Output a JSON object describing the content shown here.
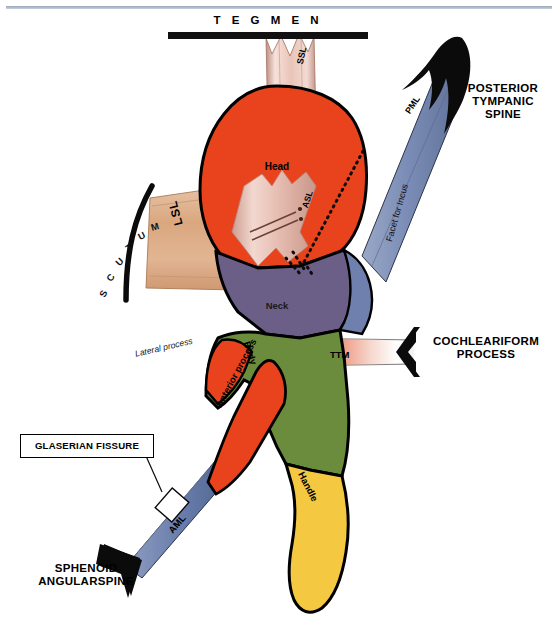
{
  "figure": {
    "callouts": {
      "tegmen": "T E G M E N",
      "tegmen_plain": "TEGMEN",
      "posterior_tympanic_spine": "POSTERIOR\nTYMPANIC\nSPINE",
      "posterior_tympanic_spine_lines": [
        "POSTERIOR",
        "TYMPANIC",
        "SPINE"
      ],
      "cochleariform_process_lines": [
        "COCHLEARIFORM",
        "PROCESS"
      ],
      "sphenoid_angularspine_lines": [
        "SPHENOID",
        "ANGULARSPINE"
      ],
      "glaserian_fissure": "GLASERIAN FISSURE"
    },
    "scutum": {
      "label": "SCUTUM",
      "letters": [
        "S",
        "C",
        "U",
        "T",
        "U",
        "M"
      ]
    },
    "ligaments": {
      "ssl": "SSL",
      "asl": "ASL",
      "lsl": "LSL",
      "pml": "PML",
      "aml": "AML",
      "ttm": "TTM"
    },
    "anatomy": {
      "head": "Head",
      "neck": "Neck",
      "body": "Body",
      "handle": "Handle",
      "anterior_process": "Anterior process",
      "lateral_process": "Lateral process",
      "facet_for_incus": "Facet for Incus"
    },
    "colors": {
      "head": "#e8431c",
      "neck": "#6b5f88",
      "facet": "#6f7fae",
      "body": "#6b8b3d",
      "handle": "#f5c842",
      "anterior_process": "#e8431c",
      "ligament_pale": "#e8bfb4",
      "lsl_tan": "#d8a98c",
      "pml_blue": "#8292b9",
      "aml_blue": "#6a7fad",
      "ttm_red": "#e8614a",
      "outline": "#000000",
      "top_rule": "#9aa7b8"
    }
  }
}
